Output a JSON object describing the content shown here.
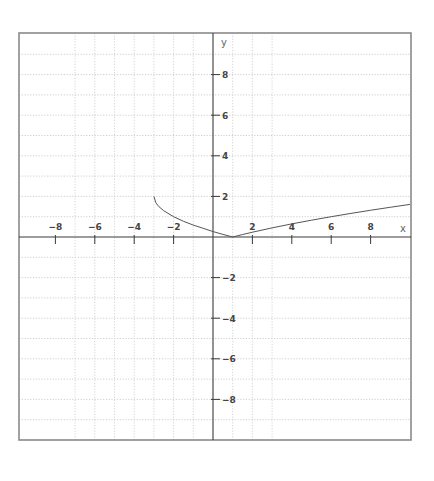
{
  "chart_data": {
    "type": "line",
    "title": "",
    "xlabel": "x",
    "ylabel": "y",
    "xlim": [
      -10,
      10
    ],
    "ylim": [
      -10,
      10
    ],
    "grid": true,
    "legend": null,
    "x_ticks": [
      -8,
      -6,
      -4,
      -2,
      2,
      4,
      6,
      8
    ],
    "y_ticks": [
      8,
      6,
      4,
      2,
      -2,
      -4,
      -6,
      -8
    ],
    "x_tick_labels": [
      "-8",
      "-6",
      "-4",
      "-2",
      "2",
      "4",
      "6",
      "8"
    ],
    "y_tick_labels": [
      "8",
      "6",
      "4",
      "2",
      "-2",
      "-4",
      "-6",
      "-8"
    ],
    "series": [
      {
        "name": "y = |sqrt(x+3) - 2|",
        "x": [
          -3,
          -2.9,
          -2.75,
          -2.5,
          -2,
          -1.5,
          -1,
          -0.5,
          0,
          0.5,
          1,
          1.5,
          2,
          3,
          4,
          5,
          6,
          7,
          8,
          9,
          10
        ],
        "y": [
          2,
          1.684,
          1.5,
          1.293,
          1,
          0.775,
          0.586,
          0.429,
          0.268,
          0.129,
          0,
          0.121,
          0.236,
          0.449,
          0.646,
          0.828,
          1,
          1.162,
          1.317,
          1.464,
          1.606
        ]
      }
    ]
  },
  "plot": {
    "frame": {
      "left": 19,
      "top": 33,
      "right": 411,
      "bottom": 440
    },
    "origin_px": {
      "x": 213,
      "y": 237
    },
    "unit_px": {
      "x": 19.7,
      "y": 20.3
    },
    "vertical_grid_x": [
      -7,
      -6,
      -5,
      -4,
      -3,
      -2,
      -1,
      1,
      2,
      3
    ],
    "horizontal_grid_y": [
      9,
      8,
      7,
      6,
      5,
      4,
      3,
      2,
      1,
      -1,
      -2,
      -3,
      -4,
      -5,
      -6,
      -7,
      -8,
      -9
    ]
  },
  "colors": {
    "frame": "#8a8a8a",
    "axis": "#3a3a3a",
    "grid": "#c8c8c8",
    "curve": "#555555",
    "text": "#444444"
  }
}
